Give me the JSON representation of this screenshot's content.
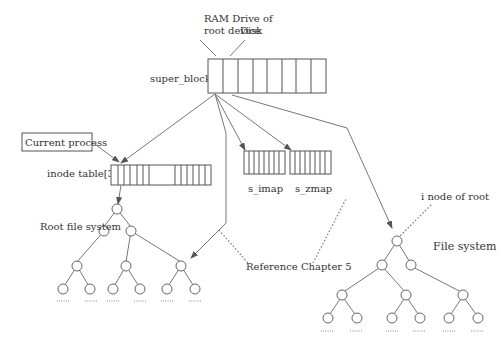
{
  "diagram": {
    "labels": {
      "ram_drive": [
        "RAM Drive of",
        "root device"
      ],
      "disk": "Disk",
      "super_block": "super_block[8]",
      "current_process": "Current process",
      "inode_table": "inode table[32]",
      "s_imap": "s_imap",
      "s_zmap": "s_zmap",
      "root_fs": "Root file system",
      "reference": "Reference Chapter 5",
      "inode_of_root": "i node of root",
      "file_system": "File system"
    },
    "structures": {
      "super_block": {
        "cells": 8
      },
      "inode_table": {
        "cells": 32,
        "visible_cells": "partial, with gap"
      },
      "s_imap": {
        "cells": 8
      },
      "s_zmap": {
        "cells": 8
      }
    },
    "trees": [
      {
        "name": "Root file system",
        "levels": 4,
        "leaves": 6
      },
      {
        "name": "File system",
        "levels": 4,
        "leaves": 6
      }
    ],
    "colors": {
      "line": "#777777",
      "text": "#333333",
      "background": "#ffffff"
    }
  }
}
